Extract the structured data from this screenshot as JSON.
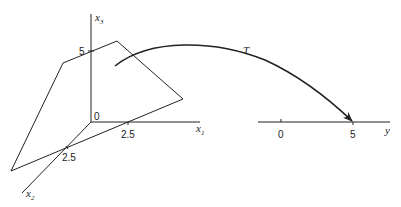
{
  "diagram": {
    "type": "linear transformation mapping",
    "domain_space": {
      "axes": [
        {
          "name": "x1",
          "label": "x",
          "subscript": "1",
          "tick_label": "2.5"
        },
        {
          "name": "x2",
          "label": "x",
          "subscript": "2",
          "tick_label": "2.5"
        },
        {
          "name": "x3",
          "label": "x",
          "subscript": "3",
          "tick_label": "5"
        }
      ],
      "origin_label": "0",
      "plane": "quadrilateral slice through 3-D space"
    },
    "transformation": {
      "label": "T"
    },
    "codomain": {
      "axis_label": "y",
      "ticks": [
        "0",
        "5"
      ]
    },
    "colors": {
      "ink": "#222222",
      "background": "#ffffff"
    }
  }
}
